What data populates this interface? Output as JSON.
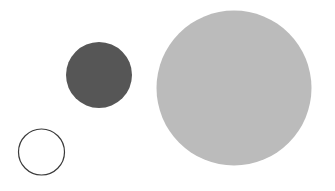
{
  "canvas": {
    "width": 335,
    "height": 191,
    "background_color": "#ffffff",
    "shape_count": 3
  },
  "shapes": [
    {
      "id": "large-light-circle",
      "kind": "circle",
      "style": "filled",
      "cx": 234,
      "cy": 88,
      "r": 77.5,
      "diameter": 155,
      "fill_color": "#bbbbbb",
      "stroke_color": "none",
      "stroke_width": 0,
      "size_label": "large",
      "tone_label": "light gray"
    },
    {
      "id": "medium-dark-circle",
      "kind": "circle",
      "style": "filled",
      "cx": 99,
      "cy": 75,
      "r": 33,
      "diameter": 66,
      "fill_color": "#565656",
      "stroke_color": "none",
      "stroke_width": 0,
      "size_label": "medium",
      "tone_label": "dark gray"
    },
    {
      "id": "small-outlined-circle",
      "kind": "circle",
      "style": "outlined",
      "cx": 41.5,
      "cy": 152,
      "r": 23,
      "diameter": 46,
      "fill_color": "#ffffff",
      "stroke_color": "#3a3a3a",
      "stroke_width": 1.2,
      "size_label": "small",
      "tone_label": "white with dark outline"
    }
  ]
}
